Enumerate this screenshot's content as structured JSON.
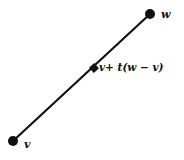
{
  "diagram": {
    "type": "line-segment-parametrization",
    "colors": {
      "stroke": "#111111",
      "background": "#ffffff"
    },
    "points": {
      "start": {
        "label": "v",
        "x": 13,
        "y": 141,
        "marker": "filled-circle"
      },
      "end": {
        "label": "w",
        "x": 150,
        "y": 14,
        "marker": "filled-circle"
      },
      "intermediate": {
        "label": "v+ t(w − v)",
        "x": 94,
        "y": 68,
        "marker": "filled-square"
      }
    },
    "segment": {
      "from": "v",
      "to": "w"
    }
  }
}
